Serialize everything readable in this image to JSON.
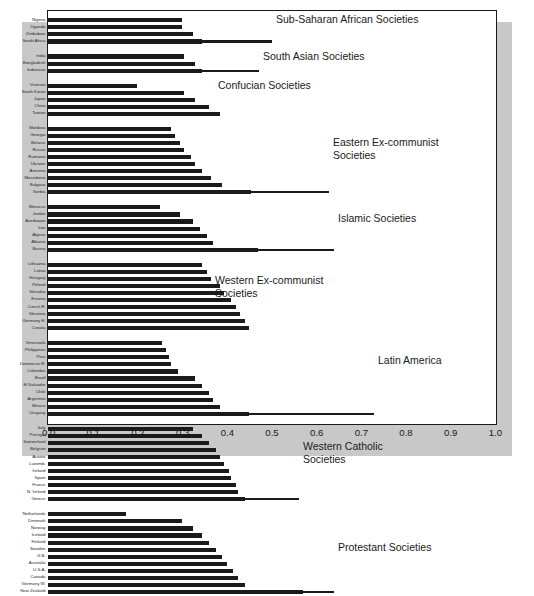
{
  "chart_data": {
    "type": "bar",
    "orientation": "horizontal",
    "title": "",
    "xlabel": "",
    "ylabel": "",
    "xlim": [
      0.0,
      1.0
    ],
    "xticks": [
      "0.0",
      "0.1",
      "0.2",
      "0.3",
      "0.4",
      "0.5",
      "0.6",
      "0.7",
      "0.8",
      "0.9",
      "1.0"
    ],
    "xtick_values": [
      0.0,
      0.1,
      0.2,
      0.3,
      0.4,
      0.5,
      0.6,
      0.7,
      0.8,
      0.9,
      1.0
    ],
    "grid": false,
    "legend": "none",
    "bar_color": "#1a1a1a",
    "plot_background": "#ffffff",
    "panel_background": "#c8c8c8",
    "groups": [
      {
        "label": "Sub-Saharan African Societies",
        "label_line1": "Sub-Saharan African Societies",
        "label_line2": "",
        "categories": [
          "Nigeria",
          "Uganda",
          "Zimbabwe",
          "South Africa"
        ],
        "values": [
          0.3,
          0.3,
          0.325,
          0.345
        ]
      },
      {
        "label": "South Asian Societies",
        "label_line1": "South Asian Societies",
        "label_line2": "",
        "categories": [
          "India",
          "Bangladesh",
          "Indonesia"
        ],
        "values": [
          0.305,
          0.33,
          0.345
        ]
      },
      {
        "label": "Confucian Societies",
        "label_line1": "Confucian Societies",
        "label_line2": "",
        "categories": [
          "Vietnam",
          "South Korea",
          "Japan",
          "China",
          "Taiwan"
        ],
        "values": [
          0.2,
          0.305,
          0.33,
          0.36,
          0.385
        ]
      },
      {
        "label": "Eastern Ex-communist Societies",
        "label_line1": "Eastern Ex-communist",
        "label_line2": "Societies",
        "categories": [
          "Moldova",
          "Georgia",
          "Belarus",
          "Russia",
          "Rumania",
          "Ukraine",
          "Armenia",
          "Macedonia",
          "Bulgaria",
          "Serbia"
        ],
        "values": [
          0.275,
          0.285,
          0.295,
          0.305,
          0.32,
          0.33,
          0.345,
          0.365,
          0.39,
          0.455
        ]
      },
      {
        "label": "Islamic Societies",
        "label_line1": "Islamic Societies",
        "label_line2": "",
        "categories": [
          "Morocco",
          "Jordan",
          "Azerbaijan",
          "Iran",
          "Algeria",
          "Albania",
          "Bosnia"
        ],
        "values": [
          0.25,
          0.295,
          0.325,
          0.34,
          0.355,
          0.37,
          0.47
        ]
      },
      {
        "label": "Western Ex-communist Societies",
        "label_line1": "Western Ex-communist",
        "label_line2": "Societies",
        "categories": [
          "Lithuania",
          "Latvia",
          "Hungary",
          "Poland",
          "Slovakia",
          "Estonia",
          "Czech R.",
          "Slovenia",
          "Germany E.",
          "Croatia"
        ],
        "values": [
          0.345,
          0.355,
          0.365,
          0.385,
          0.395,
          0.41,
          0.42,
          0.43,
          0.44,
          0.45
        ]
      },
      {
        "label": "Latin America",
        "label_line1": "Latin America",
        "label_line2": "",
        "categories": [
          "Venezuela",
          "Philippines",
          "Peru",
          "Dominican R.",
          "Colombia",
          "Brazil",
          "El Salvador",
          "Chile",
          "Argentina",
          "Mexico",
          "Uruguay"
        ],
        "values": [
          0.255,
          0.265,
          0.27,
          0.275,
          0.29,
          0.33,
          0.345,
          0.36,
          0.37,
          0.385,
          0.45
        ]
      },
      {
        "label": "Western Catholic Societies",
        "label_line1": "Western Catholic",
        "label_line2": "Societies",
        "categories": [
          "Italy",
          "Portugal",
          "Switzerland",
          "Belgium",
          "Austria",
          "Luxemb.",
          "Ireland",
          "Spain",
          "France",
          "N. Ireland",
          "Greece"
        ],
        "values": [
          0.325,
          0.345,
          0.36,
          0.375,
          0.385,
          0.395,
          0.405,
          0.41,
          0.42,
          0.425,
          0.44
        ]
      },
      {
        "label": "Protestant Societies",
        "label_line1": "Protestant Societies",
        "label_line2": "",
        "categories": [
          "Netherlands",
          "Denmark",
          "Norway",
          "Iceland",
          "Finland",
          "Sweden",
          "G.B.",
          "Australia",
          "U.S.A.",
          "Canada",
          "Germany W.",
          "New Zealand"
        ],
        "values": [
          0.175,
          0.3,
          0.325,
          0.345,
          0.36,
          0.375,
          0.39,
          0.4,
          0.415,
          0.425,
          0.44,
          0.57
        ]
      }
    ]
  }
}
